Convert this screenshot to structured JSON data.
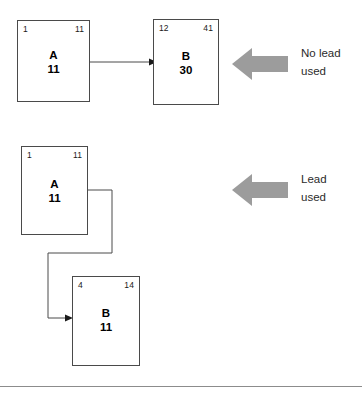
{
  "diagram": {
    "title": "",
    "colors": {
      "box_border": "#666666",
      "connector": "#4a4a4a",
      "callout_arrow": "#9c9c9c",
      "divider": "#8c8c8c",
      "text": "#1a1a1a"
    },
    "rows": [
      {
        "id": "no-lead-row",
        "callout": {
          "text": "No lead\nused",
          "arrow_icon": "left-arrow-icon",
          "direction": "left"
        },
        "nodes": [
          {
            "id": "node-a-top",
            "label": "A",
            "value": "11",
            "corner_left": "1",
            "corner_right": "11"
          },
          {
            "id": "node-b-top",
            "label": "B",
            "value": "30",
            "corner_left": "12",
            "corner_right": "41"
          }
        ],
        "connector": "straight-arrow"
      },
      {
        "id": "lead-row",
        "callout": {
          "text": "Lead\nused",
          "arrow_icon": "left-arrow-icon",
          "direction": "left"
        },
        "nodes": [
          {
            "id": "node-a-bottom",
            "label": "A",
            "value": "11",
            "corner_left": "1",
            "corner_right": "11"
          },
          {
            "id": "node-b-bottom",
            "label": "B",
            "value": "11",
            "corner_left": "4",
            "corner_right": "14"
          }
        ],
        "connector": "elbow-arrow"
      }
    ]
  }
}
